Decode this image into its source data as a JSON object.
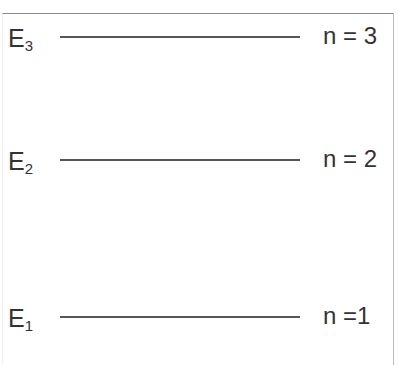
{
  "diagram": {
    "type": "energy-level-diagram",
    "levels": [
      {
        "energy_symbol": "E",
        "energy_subscript": "3",
        "quantum_label": "n = 3",
        "y": 37
      },
      {
        "energy_symbol": "E",
        "energy_subscript": "2",
        "quantum_label": "n = 2",
        "y": 160
      },
      {
        "energy_symbol": "E",
        "energy_subscript": "1",
        "quantum_label": "n =1",
        "y": 317
      }
    ],
    "colors": {
      "line": "#555555",
      "text": "#333333",
      "border": "#8a8a8a"
    }
  }
}
